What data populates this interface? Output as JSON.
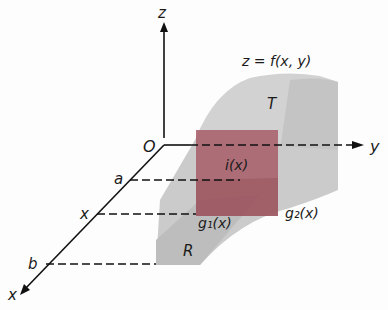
{
  "diagram": {
    "type": "3d-region-integration-figure",
    "axes": {
      "z": "z",
      "y": "y",
      "x": "x",
      "origin": "O"
    },
    "surface_label": "z = f(x, y)",
    "solid_label": "T",
    "region_label": "R",
    "x_ticks": {
      "a": "a",
      "x": "x",
      "b": "b"
    },
    "slice_label": "i(x)",
    "lower_bound_label": "g₁(x)",
    "upper_bound_label": "g₂(x)",
    "colors": {
      "axis": "#111111",
      "solid_gray": "#c8c8c8",
      "solid_gray_dark": "#b4b4b4",
      "slice": "#a8606a"
    }
  }
}
